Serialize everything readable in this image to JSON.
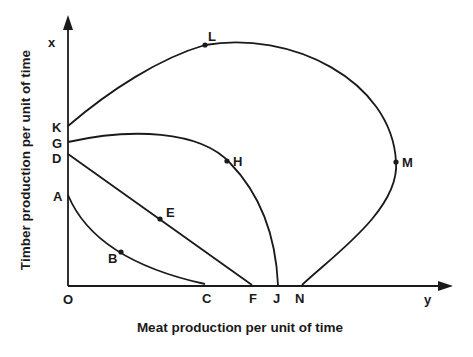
{
  "diagram": {
    "type": "production-possibility-curves",
    "y_axis_title": "Timber production per unit of time",
    "x_axis_title": "Meat production per unit of time",
    "y_axis_symbol": "x",
    "x_axis_symbol": "y",
    "origin_label": "O",
    "axis_points": {
      "K": "K",
      "G": "G",
      "D": "D",
      "A": "A",
      "C": "C",
      "F": "F",
      "J": "J",
      "N": "N"
    },
    "curve_points": {
      "L": "L",
      "M": "M",
      "H": "H",
      "E": "E",
      "B": "B"
    },
    "curves": [
      {
        "name": "A-B-C",
        "shape": "convex",
        "through": [
          "A",
          "B",
          "C"
        ]
      },
      {
        "name": "D-E-F",
        "shape": "straight",
        "through": [
          "D",
          "E",
          "F"
        ]
      },
      {
        "name": "G-H-J",
        "shape": "concave",
        "through": [
          "G",
          "H",
          "J"
        ]
      },
      {
        "name": "K-L-M-N",
        "shape": "backward-bending",
        "through": [
          "K",
          "L",
          "M",
          "N"
        ]
      }
    ],
    "colors": {
      "ink": "#1a1a1a",
      "background": "#ffffff"
    }
  }
}
